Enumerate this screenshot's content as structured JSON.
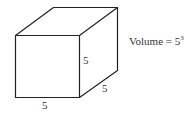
{
  "diagram": {
    "shape": "cube",
    "edge_labels": {
      "bottom": "5",
      "right_vertical": "5",
      "depth": "5"
    },
    "formula": {
      "prefix": "Volume = ",
      "base": "5",
      "exponent": "3"
    },
    "line_color": "#222222"
  }
}
